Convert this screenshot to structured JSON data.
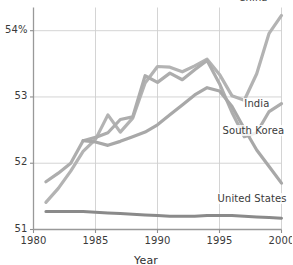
{
  "chart_data": {
    "type": "line",
    "title": "",
    "xlabel": "Year",
    "ylabel": "",
    "xlim": [
      1980,
      2000
    ],
    "ylim": [
      51,
      54.35
    ],
    "grid": true,
    "legend_position": "inline-end-of-line",
    "xticks": [
      "1980",
      "1985",
      "1990",
      "1995",
      "2000"
    ],
    "xtick_values": [
      1980,
      1985,
      1990,
      1995,
      2000
    ],
    "yticks": [
      "51",
      "52",
      "53",
      "54%"
    ],
    "ytick_values": [
      51,
      52,
      53,
      54
    ],
    "series": [
      {
        "name": "China",
        "color": "#b3b3b3",
        "label_x": 2000,
        "label_y": 54.35,
        "x": [
          1981,
          1982,
          1983,
          1984,
          1985,
          1986,
          1987,
          1988,
          1989,
          1990,
          1991,
          1992,
          1993,
          1994,
          1995,
          1996,
          1997,
          1998,
          1999,
          2000
        ],
        "values": [
          51.41,
          51.62,
          51.88,
          52.18,
          52.36,
          52.73,
          52.47,
          52.68,
          53.21,
          53.46,
          53.45,
          53.38,
          53.47,
          53.57,
          53.34,
          53.02,
          52.95,
          53.35,
          53.96,
          54.23
        ]
      },
      {
        "name": "India",
        "color": "#adadad",
        "label_x": 1996.6,
        "label_y": 52.92,
        "x": [
          1981,
          1982,
          1983,
          1984,
          1985,
          1986,
          1987,
          1988,
          1989,
          1990,
          1991,
          1992,
          1993,
          1994,
          1995,
          1996,
          1997,
          1998,
          1999,
          2000
        ],
        "values": [
          51.72,
          51.85,
          52.0,
          52.34,
          52.39,
          52.46,
          52.66,
          52.7,
          53.32,
          53.22,
          53.36,
          53.26,
          53.41,
          53.55,
          53.2,
          52.77,
          52.4,
          52.46,
          52.78,
          52.9
        ]
      },
      {
        "name": "South Korea",
        "color": "#a8a8a8",
        "label_x": 1995.0,
        "label_y": 52.52,
        "x": [
          1984,
          1985,
          1986,
          1987,
          1988,
          1989,
          1990,
          1991,
          1992,
          1993,
          1994,
          1995,
          1996,
          1997,
          1998,
          1999,
          2000
        ],
        "values": [
          52.34,
          52.32,
          52.27,
          52.33,
          52.4,
          52.47,
          52.58,
          52.73,
          52.88,
          53.03,
          53.14,
          53.09,
          52.86,
          52.52,
          52.2,
          51.95,
          51.7
        ]
      },
      {
        "name": "United States",
        "color": "#8a8a8a",
        "label_x": 1994.6,
        "label_y": 51.34,
        "x": [
          1981,
          1982,
          1983,
          1984,
          1985,
          1986,
          1987,
          1988,
          1989,
          1990,
          1991,
          1992,
          1993,
          1994,
          1995,
          1996,
          1997,
          1998,
          1999,
          2000
        ],
        "values": [
          51.27,
          51.27,
          51.27,
          51.27,
          51.26,
          51.25,
          51.24,
          51.23,
          51.22,
          51.21,
          51.2,
          51.2,
          51.2,
          51.21,
          51.21,
          51.21,
          51.2,
          51.19,
          51.18,
          51.17
        ]
      }
    ]
  },
  "axis": {
    "x_title": "Year"
  }
}
